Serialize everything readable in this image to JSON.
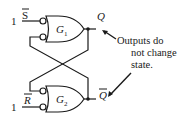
{
  "diagram": {
    "gates": [
      {
        "id": "G1",
        "label": "G",
        "subscript": "1"
      },
      {
        "id": "G2",
        "label": "G",
        "subscript": "2"
      }
    ],
    "inputs": {
      "S": {
        "name": "S",
        "overbar": true,
        "value": "1"
      },
      "R": {
        "name": "R",
        "overbar": true,
        "value": "1"
      }
    },
    "outputs": {
      "Q": {
        "name": "Q"
      },
      "Qbar": {
        "name": "Q",
        "overbar": true
      }
    },
    "annotation": {
      "lines": [
        "Outputs do",
        "not change",
        "state."
      ]
    },
    "colors": {
      "stroke": "#1a1a1a",
      "background": "#ffffff"
    }
  }
}
